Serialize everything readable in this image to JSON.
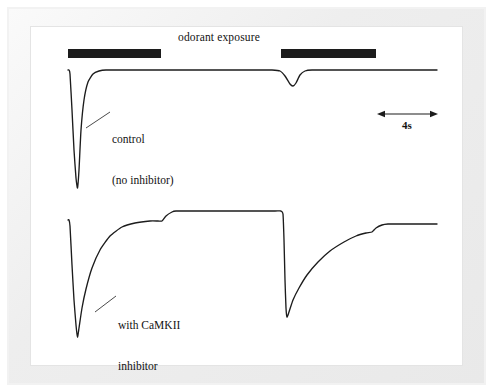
{
  "figure": {
    "title": "odorant exposure",
    "background_color": "#ffffff",
    "mat_color": "#f0f0f0",
    "trace_color": "#1c1c1c",
    "stimulus_bar_color": "#1c1c1c"
  },
  "annotations": {
    "control_label_line1": "control",
    "control_label_line2": "(no inhibitor)",
    "inhibitor_label_line1": "with CaMKII",
    "inhibitor_label_line2": "inhibitor",
    "scalebar_label": "4s"
  },
  "chart_data": {
    "type": "line",
    "title": "odorant exposure",
    "xlabel": "",
    "ylabel": "",
    "grid": false,
    "legend_position": "inline-annotation",
    "xlim": [
      0,
      100
    ],
    "ylim": [
      -1.05,
      0.12
    ],
    "scalebar": {
      "label": "4s",
      "seconds": 4,
      "x_start": 378,
      "x_end": 437,
      "y": 114
    },
    "stimulus_bars": [
      {
        "name": "odorant-pulse-1",
        "x_start": 68,
        "x_end": 161,
        "y": 49
      },
      {
        "name": "odorant-pulse-2",
        "x_start": 281,
        "x_end": 376,
        "y": 49
      }
    ],
    "series": [
      {
        "name": "control (no inhibitor)",
        "description": "Rapid transient hyperpolarization with fast full adaptation; second odorant pulse evokes only a small residual response.",
        "points": [
          [
            68,
            70
          ],
          [
            69,
            70
          ],
          [
            70,
            74
          ],
          [
            72,
            110
          ],
          [
            74,
            150
          ],
          [
            76,
            178
          ],
          [
            77.5,
            188
          ],
          [
            79,
            170
          ],
          [
            81,
            130
          ],
          [
            84,
            100
          ],
          [
            88,
            82
          ],
          [
            93,
            74
          ],
          [
            99,
            71
          ],
          [
            106,
            70
          ],
          [
            140,
            70
          ],
          [
            200,
            70
          ],
          [
            262,
            70
          ],
          [
            272,
            70
          ],
          [
            280,
            71
          ],
          [
            285,
            76
          ],
          [
            290,
            84
          ],
          [
            293,
            86
          ],
          [
            296,
            83
          ],
          [
            300,
            75
          ],
          [
            305,
            71
          ],
          [
            312,
            70
          ],
          [
            340,
            70
          ],
          [
            380,
            70
          ],
          [
            410,
            70
          ],
          [
            437,
            70
          ]
        ]
      },
      {
        "name": "with CaMKII inhibitor",
        "description": "Same odorant pulses produce a large response with markedly slowed recovery; adaptation is blocked so the second pulse again evokes a near-full response.",
        "points": [
          [
            68,
            220
          ],
          [
            69,
            220
          ],
          [
            70,
            226
          ],
          [
            72,
            265
          ],
          [
            74,
            300
          ],
          [
            76,
            325
          ],
          [
            77.5,
            337
          ],
          [
            79,
            328
          ],
          [
            82,
            308
          ],
          [
            86,
            289
          ],
          [
            92,
            268
          ],
          [
            100,
            250
          ],
          [
            110,
            236
          ],
          [
            122,
            227
          ],
          [
            135,
            223
          ],
          [
            150,
            221
          ],
          [
            158,
            221
          ],
          [
            162,
            221
          ],
          [
            166,
            216
          ],
          [
            172,
            212
          ],
          [
            176,
            211
          ],
          [
            185,
            211
          ],
          [
            210,
            211
          ],
          [
            250,
            211
          ],
          [
            275,
            211
          ],
          [
            281,
            211
          ],
          [
            283,
            214
          ],
          [
            284,
            240
          ],
          [
            285,
            280
          ],
          [
            286,
            308
          ],
          [
            287,
            317
          ],
          [
            289,
            312
          ],
          [
            293,
            300
          ],
          [
            299,
            288
          ],
          [
            307,
            275
          ],
          [
            318,
            262
          ],
          [
            330,
            251
          ],
          [
            344,
            242
          ],
          [
            356,
            236
          ],
          [
            366,
            233
          ],
          [
            372,
            232
          ],
          [
            376,
            228
          ],
          [
            382,
            225
          ],
          [
            388,
            224
          ],
          [
            396,
            224
          ],
          [
            410,
            224
          ],
          [
            425,
            224
          ],
          [
            437,
            224
          ]
        ]
      }
    ]
  }
}
